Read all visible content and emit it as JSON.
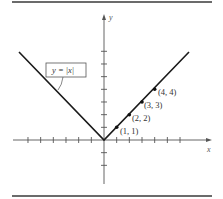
{
  "figure": {
    "function_label": "y = |x|",
    "x_axis_label": "x",
    "y_axis_label": "y",
    "points": [
      {
        "label": "(1, 1)",
        "x": 1,
        "y": 1
      },
      {
        "label": "(2, 2)",
        "x": 2,
        "y": 2
      },
      {
        "label": "(3, 3)",
        "x": 3,
        "y": 3
      },
      {
        "label": "(4, 4)",
        "x": 4,
        "y": 4
      }
    ],
    "x_ticks": [
      -6,
      -5,
      -4,
      -3,
      -2,
      -1,
      1,
      2,
      3,
      4,
      5,
      6
    ],
    "y_ticks": [
      -2,
      -1,
      1,
      2,
      3,
      4,
      5,
      6,
      7
    ],
    "line_color": "#1a1a1a",
    "axis_color": "#555555"
  },
  "chart_data": {
    "type": "line",
    "title": "y = |x|",
    "xlabel": "x",
    "ylabel": "y",
    "x": [
      -6.7,
      -5,
      -4,
      -3,
      -2,
      -1,
      0,
      1,
      2,
      3,
      4,
      5,
      6.7
    ],
    "series": [
      {
        "name": "y = |x|",
        "values": [
          6.7,
          5,
          4,
          3,
          2,
          1,
          0,
          1,
          2,
          3,
          4,
          5,
          6.7
        ]
      }
    ],
    "marked_points": [
      [
        1,
        1
      ],
      [
        2,
        2
      ],
      [
        3,
        3
      ],
      [
        4,
        4
      ]
    ],
    "xlim": [
      -7,
      8
    ],
    "ylim": [
      -4,
      7.5
    ],
    "grid": false,
    "legend": "callout box pointing to left branch"
  }
}
